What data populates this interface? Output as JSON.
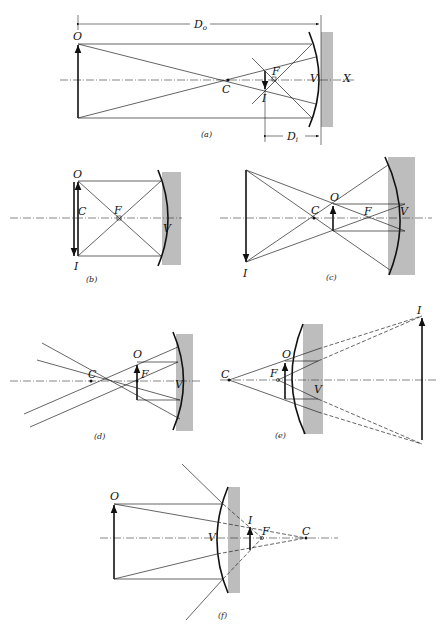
{
  "figure": {
    "panels": [
      {
        "id": "a",
        "caption": "(a)",
        "labels": {
          "object": "O",
          "center": "C",
          "focus": "F",
          "image": "I",
          "vertex": "V",
          "axis": "X",
          "object_distance": "D",
          "object_distance_sub": "o",
          "image_distance": "D",
          "image_distance_sub": "i"
        }
      },
      {
        "id": "b",
        "caption": "(b)",
        "labels": {
          "object": "O",
          "center": "C",
          "focus": "F",
          "image": "I",
          "vertex": "V"
        }
      },
      {
        "id": "c",
        "caption": "(c)",
        "labels": {
          "object": "O",
          "center": "C",
          "focus": "F",
          "image": "I",
          "vertex": "V"
        }
      },
      {
        "id": "d",
        "caption": "(d)",
        "labels": {
          "object": "O",
          "center": "C",
          "focus": "F",
          "vertex": "V"
        }
      },
      {
        "id": "e",
        "caption": "(e)",
        "labels": {
          "object": "O",
          "center": "C",
          "focus": "F",
          "image": "I",
          "vertex": "V"
        }
      },
      {
        "id": "f",
        "caption": "(f)",
        "labels": {
          "object": "O",
          "center": "C",
          "focus": "F",
          "image": "I",
          "vertex": "V"
        }
      }
    ]
  },
  "colors": {
    "ink": "#111111",
    "mirror_shade": "#bdbdbd",
    "background": "#ffffff"
  }
}
